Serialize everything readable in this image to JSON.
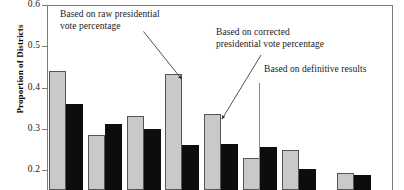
{
  "chart_data": {
    "type": "bar",
    "title": "",
    "xlabel": "",
    "ylabel": "Proportion of Districts",
    "ylim": [
      0.152,
      0.6
    ],
    "yticks": [
      0.6,
      0.5,
      0.4,
      0.3,
      0.2
    ],
    "ytick_labels": [
      "0.6",
      "0.5",
      "0.4",
      "0.3",
      "0.2"
    ],
    "grid": false,
    "legend_position": "none",
    "categories": [
      "1",
      "2",
      "3",
      "4",
      "5",
      "6",
      "7",
      "8"
    ],
    "series": [
      {
        "name": "Based on raw presidential vote percentage",
        "color": "#c9c9c9",
        "values": [
          0.44,
          0.286,
          0.331,
          0.434,
          0.336,
          0.23,
          0.249,
          0.192
        ]
      },
      {
        "name": "Based on corrected presidential vote percentage",
        "color": "#0d0d0d",
        "values": [
          0.36,
          0.312,
          0.299,
          0.261,
          0.263,
          0.256,
          0.202,
          0.188
        ]
      }
    ],
    "annotations": [
      {
        "id": "raw",
        "text": "Based on raw presidential\nvote percentage",
        "points_to": "series-1-bar-4"
      },
      {
        "id": "corrected",
        "text": "Based on corrected\npresidential vote percentage",
        "points_to": "series-2-bar-5"
      },
      {
        "id": "definitive",
        "text": "Based on definitive results",
        "points_to": "group-divider"
      }
    ]
  }
}
